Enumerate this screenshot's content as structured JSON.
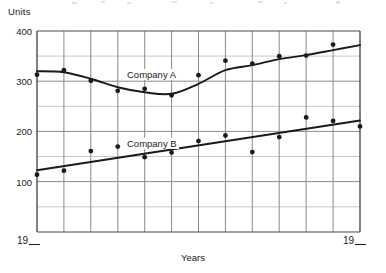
{
  "chart_data": {
    "type": "scatter",
    "title": "",
    "subtitle": "",
    "ylabel": "Units",
    "xlabel": "Years",
    "xtick_labels": [
      "19__",
      "19__"
    ],
    "ytick_labels": [
      "400",
      "300",
      "200",
      "100"
    ],
    "ytick_values": [
      400,
      300,
      200,
      100
    ],
    "ylim": [
      0,
      400
    ],
    "xlim": [
      0,
      12
    ],
    "grid": true,
    "grid_minor_y": [
      50,
      150,
      250,
      350
    ],
    "grid_columns": 12,
    "legend_position": "inline-annotation",
    "series": [
      {
        "name": "Company A",
        "label_text": "Company A",
        "marker": "filled-circle",
        "color": "#1a1a1a",
        "trend": "smooth-curve",
        "x": [
          0,
          1,
          2,
          3,
          4,
          5,
          6,
          7,
          8,
          9,
          10,
          11,
          12
        ],
        "values": [
          313,
          322,
          301,
          281,
          285,
          272,
          312,
          341,
          335,
          350,
          228,
          351,
          373
        ],
        "points": [
          {
            "x": 0,
            "y": 313
          },
          {
            "x": 1,
            "y": 322
          },
          {
            "x": 2,
            "y": 301
          },
          {
            "x": 3,
            "y": 281
          },
          {
            "x": 4,
            "y": 285
          },
          {
            "x": 5,
            "y": 272
          },
          {
            "x": 6,
            "y": 312
          },
          {
            "x": 7,
            "y": 341
          },
          {
            "x": 8,
            "y": 335
          },
          {
            "x": 9,
            "y": 350
          },
          {
            "x": 10,
            "y": 351
          },
          {
            "x": 11,
            "y": 373
          }
        ],
        "curve": [
          {
            "x": 0,
            "y": 320
          },
          {
            "x": 1,
            "y": 318
          },
          {
            "x": 2,
            "y": 305
          },
          {
            "x": 3,
            "y": 288
          },
          {
            "x": 4,
            "y": 278
          },
          {
            "x": 5,
            "y": 275
          },
          {
            "x": 6,
            "y": 295
          },
          {
            "x": 7,
            "y": 322
          },
          {
            "x": 8,
            "y": 332
          },
          {
            "x": 9,
            "y": 344
          },
          {
            "x": 10,
            "y": 352
          },
          {
            "x": 11,
            "y": 362
          },
          {
            "x": 12,
            "y": 372
          }
        ]
      },
      {
        "name": "Company B",
        "label_text": "Company B",
        "marker": "filled-circle",
        "color": "#1a1a1a",
        "trend": "straight-line",
        "x": [
          0,
          1,
          2,
          3,
          4,
          5,
          6,
          7,
          8,
          9,
          10,
          11,
          12
        ],
        "values": [
          114,
          122,
          161,
          170,
          149,
          158,
          181,
          192,
          159,
          189,
          228,
          221,
          210
        ],
        "points": [
          {
            "x": 0,
            "y": 114
          },
          {
            "x": 1,
            "y": 122
          },
          {
            "x": 2,
            "y": 161
          },
          {
            "x": 3,
            "y": 170
          },
          {
            "x": 4,
            "y": 149
          },
          {
            "x": 5,
            "y": 158
          },
          {
            "x": 6,
            "y": 181
          },
          {
            "x": 7,
            "y": 192
          },
          {
            "x": 8,
            "y": 159
          },
          {
            "x": 9,
            "y": 189
          },
          {
            "x": 10,
            "y": 228
          },
          {
            "x": 11,
            "y": 221
          },
          {
            "x": 12,
            "y": 210
          }
        ],
        "line": [
          {
            "x": 0,
            "y": 123
          },
          {
            "x": 12,
            "y": 222
          }
        ]
      }
    ]
  },
  "axes": {
    "y_title": "Units",
    "x_title": "Years",
    "x_start_label": "19",
    "x_end_label": "19",
    "ticks_y": [
      {
        "label": "400",
        "value": 400
      },
      {
        "label": "300",
        "value": 300
      },
      {
        "label": "200",
        "value": 200
      },
      {
        "label": "100",
        "value": 100
      }
    ]
  }
}
